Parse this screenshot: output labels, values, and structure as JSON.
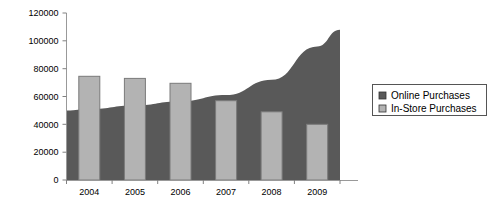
{
  "chart_data": {
    "type": "bar",
    "title": "",
    "xlabel": "",
    "ylabel": "",
    "categories": [
      "2004",
      "2005",
      "2006",
      "2007",
      "2008",
      "2009"
    ],
    "ylim": [
      0,
      120000
    ],
    "yticks": [
      0,
      20000,
      40000,
      60000,
      80000,
      100000,
      120000
    ],
    "ytick_labels": [
      "0",
      "20000",
      "40000",
      "60000",
      "80000",
      "100000",
      "120000"
    ],
    "grid": false,
    "legend_position": "right",
    "series": [
      {
        "name": "Online Purchases",
        "type": "area",
        "color": "#595959",
        "values": [
          51000,
          53500,
          56500,
          61000,
          72000,
          96000
        ]
      },
      {
        "name": "In-Store Purchases",
        "type": "bar",
        "color": "#b3b3b3",
        "values": [
          74500,
          73000,
          69500,
          57000,
          49000,
          40000
        ]
      }
    ]
  },
  "legend": {
    "items": [
      {
        "label": "Online Purchases",
        "swatch": "#595959"
      },
      {
        "label": "In-Store Purchases",
        "swatch": "#b3b3b3"
      }
    ]
  },
  "axis": {
    "line_color": "#999999",
    "tick_color": "#808080"
  }
}
